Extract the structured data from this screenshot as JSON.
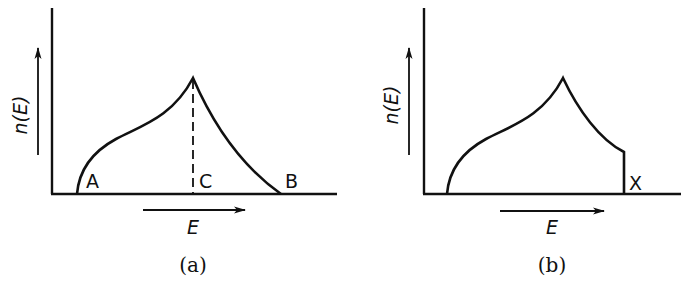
{
  "figure": {
    "panels": [
      {
        "id": "a",
        "caption": "(a)",
        "y_label": "n(E)",
        "x_label": "E",
        "point_labels": [
          "A",
          "C",
          "B"
        ],
        "description": "Distribution rising from A to a cusp peak above C, then falling to zero at B; dashed vertical line from peak to C"
      },
      {
        "id": "b",
        "caption": "(b)",
        "y_label": "n(E)",
        "x_label": "E",
        "point_labels": [
          "X"
        ],
        "description": "Same rising curve and cusp peak, but the falling branch is truncated abruptly by a vertical drop to zero at X"
      }
    ]
  },
  "labels": {
    "a": {
      "caption": "(a)",
      "y": "n(E)",
      "x": "E",
      "A": "A",
      "B": "B",
      "C": "C"
    },
    "b": {
      "caption": "(b)",
      "y": "n(E)",
      "x": "E",
      "X": "X"
    }
  },
  "colors": {
    "ink": "#111111",
    "background": "#ffffff"
  }
}
